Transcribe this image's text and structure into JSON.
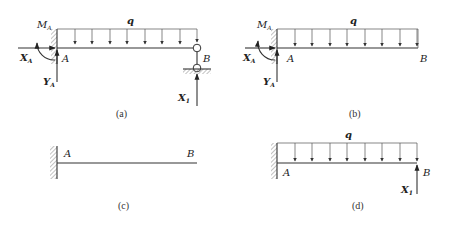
{
  "figure": {
    "panels": [
      {
        "id": "a",
        "caption": "(a)",
        "load_label": "q",
        "labels": {
          "moment": "M",
          "moment_sub": "A",
          "xreact": "X",
          "xreact_sub": "A",
          "yreact": "Y",
          "yreact_sub": "A",
          "point_a": "A",
          "point_b": "B",
          "redundant": "X",
          "redundant_sub": "1"
        },
        "support_a": "fixed wall",
        "support_b": "pinned link to ground (roller)"
      },
      {
        "id": "b",
        "caption": "(b)",
        "load_label": "q",
        "labels": {
          "moment": "M",
          "moment_sub": "A",
          "xreact": "X",
          "xreact_sub": "A",
          "yreact": "Y",
          "yreact_sub": "A",
          "point_a": "A",
          "point_b": "B"
        },
        "support_a": "fixed wall",
        "support_b": "free end"
      },
      {
        "id": "c",
        "caption": "(c)",
        "labels": {
          "point_a": "A",
          "point_b": "B"
        },
        "support_a": "fixed wall",
        "support_b": "free end"
      },
      {
        "id": "d",
        "caption": "(d)",
        "load_label": "q",
        "labels": {
          "point_a": "A",
          "point_b": "B",
          "redundant": "X",
          "redundant_sub": "1"
        },
        "support_a": "fixed wall",
        "support_b": "free end with redundant force"
      }
    ],
    "colors": {
      "ink": "#333333",
      "background": "#ffffff"
    }
  }
}
